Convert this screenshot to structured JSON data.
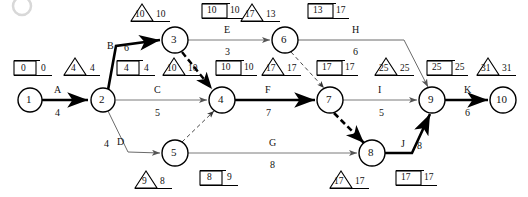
{
  "diagram": {
    "corner_badge": "",
    "nodes": [
      {
        "id": "1",
        "label": "1",
        "cx": 30,
        "cy": 100,
        "r": 12
      },
      {
        "id": "2",
        "label": "2",
        "cx": 103,
        "cy": 100,
        "r": 12
      },
      {
        "id": "3",
        "label": "3",
        "cx": 175,
        "cy": 40,
        "r": 13
      },
      {
        "id": "4",
        "label": "4",
        "cx": 222,
        "cy": 100,
        "r": 13
      },
      {
        "id": "5",
        "label": "5",
        "cx": 175,
        "cy": 153,
        "r": 13
      },
      {
        "id": "6",
        "label": "6",
        "cx": 285,
        "cy": 40,
        "r": 13
      },
      {
        "id": "7",
        "label": "7",
        "cx": 330,
        "cy": 100,
        "r": 13
      },
      {
        "id": "8",
        "label": "8",
        "cx": 372,
        "cy": 153,
        "r": 13
      },
      {
        "id": "9",
        "label": "9",
        "cx": 432,
        "cy": 100,
        "r": 13
      },
      {
        "id": "10",
        "label": "10",
        "cx": 503,
        "cy": 100,
        "r": 13
      }
    ],
    "activities": [
      {
        "name": "A",
        "duration": "4",
        "from": "1",
        "to": "2",
        "critical": true,
        "name_x": 57,
        "name_y": 92,
        "dur_x": 57,
        "dur_y": 114
      },
      {
        "name": "B",
        "duration": "6",
        "from": "2",
        "to": "3",
        "critical": true,
        "name_x": 110,
        "name_y": 48,
        "dur_x": 127,
        "dur_y": 50
      },
      {
        "name": "C",
        "duration": "5",
        "from": "2",
        "to": "4",
        "critical": false,
        "name_x": 157,
        "name_y": 92,
        "dur_x": 157,
        "dur_y": 114
      },
      {
        "name": "D",
        "duration": "4",
        "from": "2",
        "to": "5",
        "critical": false,
        "name_x": 120,
        "name_y": 144,
        "dur_x": 106,
        "dur_y": 146
      },
      {
        "name": "E",
        "duration": "3",
        "from": "3",
        "to": "6",
        "critical": false,
        "name_x": 227,
        "name_y": 33,
        "dur_x": 227,
        "dur_y": 55
      },
      {
        "name": "F",
        "duration": "7",
        "from": "4",
        "to": "7",
        "critical": true,
        "name_x": 268,
        "name_y": 92,
        "dur_x": 268,
        "dur_y": 114
      },
      {
        "name": "G",
        "duration": "8",
        "from": "5",
        "to": "8",
        "critical": false,
        "name_x": 272,
        "name_y": 145,
        "dur_x": 272,
        "dur_y": 166
      },
      {
        "name": "H",
        "duration": "6",
        "from": "6",
        "to": "9",
        "critical": false,
        "name_x": 355,
        "name_y": 33,
        "dur_x": 355,
        "dur_y": 55
      },
      {
        "name": "I",
        "duration": "5",
        "from": "7",
        "to": "9",
        "critical": false,
        "name_x": 380,
        "name_y": 92,
        "dur_x": 380,
        "dur_y": 114
      },
      {
        "name": "J",
        "duration": "8",
        "from": "8",
        "to": "9",
        "critical": true,
        "name_x": 404,
        "name_y": 146,
        "dur_x": 422,
        "dur_y": 148
      },
      {
        "name": "K",
        "duration": "6",
        "from": "9",
        "to": "10",
        "critical": true,
        "name_x": 467,
        "name_y": 92,
        "dur_x": 467,
        "dur_y": 114
      }
    ],
    "dummy_activities": [
      {
        "from": "3",
        "to": "4",
        "label": ""
      },
      {
        "from": "6",
        "to": "7",
        "label": ""
      },
      {
        "from": "5",
        "to": "4",
        "label": ""
      },
      {
        "from": "7",
        "to": "8",
        "label": "",
        "critical": true
      }
    ],
    "node_annotations": [
      {
        "node": "1",
        "triangle": null,
        "triangle_right": null,
        "box_left": "0",
        "box_right": "0",
        "tri_x": 0,
        "tri_y": 0,
        "box_x": 14,
        "box_y": 62
      },
      {
        "node": "2",
        "triangle": "4",
        "triangle_right": "4",
        "box_left": null,
        "box_right": null,
        "tri_x": 64,
        "tri_y": 62,
        "box_x": 0,
        "box_y": 0
      },
      {
        "node": "2b",
        "triangle": null,
        "triangle_right": null,
        "box_left": "4",
        "box_right": "4",
        "tri_x": 0,
        "tri_y": 0,
        "box_x": 117,
        "box_y": 62
      },
      {
        "node": "3",
        "triangle": "10",
        "triangle_right": "10",
        "box_left": "10",
        "box_right": "10",
        "tri_x": 131,
        "tri_y": 5,
        "box_x": 202,
        "box_y": 5
      },
      {
        "node": "4a",
        "triangle": "10",
        "triangle_right": "10",
        "box_left": null,
        "box_right": null,
        "tri_x": 163,
        "tri_y": 62,
        "box_x": 0,
        "box_y": 0
      },
      {
        "node": "4b",
        "triangle": null,
        "triangle_right": null,
        "box_left": "10",
        "box_right": "10",
        "tri_x": 0,
        "tri_y": 0,
        "box_x": 216,
        "box_y": 62
      },
      {
        "node": "5",
        "triangle": "9",
        "triangle_right": "8",
        "box_left": "8",
        "box_right": "9",
        "tri_x": 135,
        "tri_y": 172,
        "box_x": 200,
        "box_y": 172
      },
      {
        "node": "6",
        "triangle": "17",
        "triangle_right": "13",
        "box_left": "13",
        "box_right": "17",
        "tri_x": 241,
        "tri_y": 5,
        "box_x": 308,
        "box_y": 5
      },
      {
        "node": "7a",
        "triangle": "17",
        "triangle_right": "17",
        "box_left": null,
        "box_right": null,
        "tri_x": 262,
        "tri_y": 62,
        "box_x": 0,
        "box_y": 0
      },
      {
        "node": "7b",
        "triangle": null,
        "triangle_right": null,
        "box_left": "17",
        "box_right": "17",
        "tri_x": 0,
        "tri_y": 0,
        "box_x": 317,
        "box_y": 62
      },
      {
        "node": "8",
        "triangle": "17",
        "triangle_right": "17",
        "box_left": "17",
        "box_right": "17",
        "tri_x": 330,
        "tri_y": 172,
        "box_x": 396,
        "box_y": 172
      },
      {
        "node": "9a",
        "triangle": "25",
        "triangle_right": "25",
        "box_left": null,
        "box_right": null,
        "tri_x": 375,
        "tri_y": 62,
        "box_x": 0,
        "box_y": 0
      },
      {
        "node": "9b",
        "triangle": null,
        "triangle_right": null,
        "box_left": "25",
        "box_right": "25",
        "tri_x": 0,
        "tri_y": 0,
        "box_x": 427,
        "box_y": 62
      },
      {
        "node": "10",
        "triangle": "31",
        "triangle_right": "31",
        "box_left": null,
        "box_right": null,
        "tri_x": 477,
        "tri_y": 62,
        "box_x": 0,
        "box_y": 0
      }
    ],
    "colors": {
      "critical_path": "#000000",
      "normal_path": "#808080",
      "node_stroke": "#000000",
      "text": "#111111",
      "background": "#ffffff"
    }
  }
}
